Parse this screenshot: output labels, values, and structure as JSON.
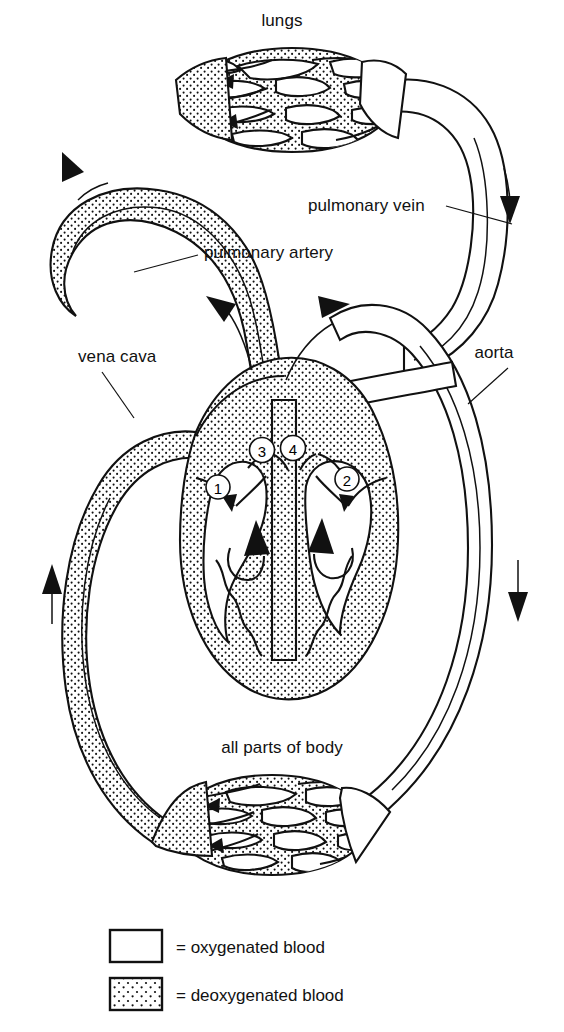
{
  "diagram": {
    "labels": {
      "lungs": "lungs",
      "pulmonary_vein": "pulmonary vein",
      "pulmonary_artery": "pulmonary artery",
      "vena_cava": "vena cava",
      "aorta": "aorta",
      "body": "all parts of body"
    },
    "valve_markers": [
      {
        "id": "1",
        "label": "1"
      },
      {
        "id": "2",
        "label": "2"
      },
      {
        "id": "3",
        "label": "3"
      },
      {
        "id": "4",
        "label": "4"
      }
    ],
    "legend": {
      "items": [
        {
          "key": "oxygenated",
          "text": "= oxygenated blood",
          "fill": "white"
        },
        {
          "key": "deoxygenated",
          "text": "= deoxygenated blood",
          "fill": "stippled"
        }
      ]
    },
    "colors": {
      "ink": "#111111",
      "paper": "#ffffff",
      "stipple": "#111111"
    }
  }
}
